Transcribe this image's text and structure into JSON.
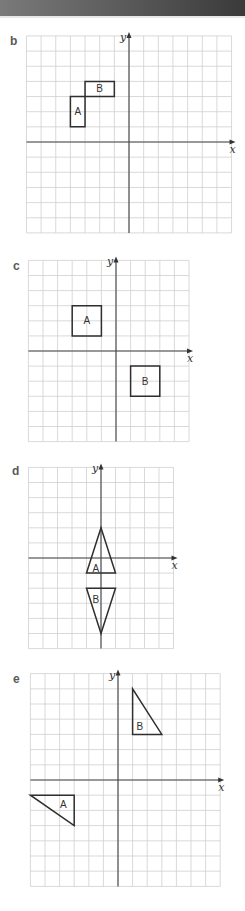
{
  "header": {
    "banner_colors": [
      "#7a7a7a",
      "#3a3a3a"
    ]
  },
  "diagrams": [
    {
      "id": "b",
      "label": "b",
      "label_pos": [
        10,
        34
      ],
      "origin_px": [
        129,
        142
      ],
      "cell_px": [
        14.65,
        15.15
      ],
      "cols": [
        -7,
        7
      ],
      "rows": [
        -6,
        7
      ],
      "x_label": "x",
      "y_label": "y",
      "shapes": [
        {
          "name": "A",
          "label": "A",
          "type": "polygon",
          "points": [
            [
              -4,
              1
            ],
            [
              -3,
              1
            ],
            [
              -3,
              3
            ],
            [
              -4,
              3
            ]
          ],
          "label_at": [
            -3.5,
            2
          ]
        },
        {
          "name": "B",
          "label": "B",
          "type": "polygon",
          "points": [
            [
              -3,
              3
            ],
            [
              -1,
              3
            ],
            [
              -1,
              4
            ],
            [
              -3,
              4
            ]
          ],
          "label_at": [
            -2,
            3.5
          ]
        }
      ]
    },
    {
      "id": "c",
      "label": "c",
      "label_pos": [
        13,
        259
      ],
      "origin_px": [
        116,
        351
      ],
      "cell_px": [
        14.6,
        15.1
      ],
      "cols": [
        -6,
        5
      ],
      "rows": [
        -6,
        6
      ],
      "x_label": "x",
      "y_label": "y",
      "shapes": [
        {
          "name": "A",
          "label": "A",
          "type": "polygon",
          "points": [
            [
              -3,
              1
            ],
            [
              -1,
              1
            ],
            [
              -1,
              3
            ],
            [
              -3,
              3
            ]
          ],
          "label_at": [
            -2,
            2
          ]
        },
        {
          "name": "B",
          "label": "B",
          "type": "polygon",
          "points": [
            [
              1,
              -1
            ],
            [
              3,
              -1
            ],
            [
              3,
              -3
            ],
            [
              1,
              -3
            ]
          ],
          "label_at": [
            2,
            -2
          ]
        }
      ]
    },
    {
      "id": "d",
      "label": "d",
      "label_pos": [
        12,
        464
      ],
      "origin_px": [
        101,
        558
      ],
      "cell_px": [
        14.5,
        15.1
      ],
      "cols": [
        -5,
        5
      ],
      "rows": [
        -6,
        6
      ],
      "x_label": "x",
      "y_label": "y",
      "shapes": [
        {
          "name": "A",
          "label": "A",
          "type": "polygon",
          "points": [
            [
              0,
              2
            ],
            [
              1,
              -1
            ],
            [
              -1,
              -1
            ]
          ],
          "label_at": [
            -0.35,
            -0.7
          ]
        },
        {
          "name": "B",
          "label": "B",
          "type": "polygon",
          "points": [
            [
              -1,
              -2
            ],
            [
              1,
              -2
            ],
            [
              0,
              -5
            ]
          ],
          "label_at": [
            -0.35,
            -2.75
          ]
        }
      ]
    },
    {
      "id": "e",
      "label": "e",
      "label_pos": [
        13,
        672
      ],
      "origin_px": [
        118,
        780
      ],
      "cell_px": [
        14.6,
        15.2
      ],
      "cols": [
        -6,
        7
      ],
      "rows": [
        -7,
        7
      ],
      "x_label": "x",
      "y_label": "y",
      "shapes": [
        {
          "name": "A",
          "label": "A",
          "type": "polygon",
          "points": [
            [
              -6,
              -1
            ],
            [
              -3,
              -1
            ],
            [
              -3,
              -3
            ]
          ],
          "label_at": [
            -3.75,
            -1.6
          ]
        },
        {
          "name": "B",
          "label": "B",
          "type": "polygon",
          "points": [
            [
              1,
              6
            ],
            [
              1,
              3
            ],
            [
              3,
              3
            ]
          ],
          "label_at": [
            1.5,
            3.5
          ]
        }
      ]
    }
  ]
}
